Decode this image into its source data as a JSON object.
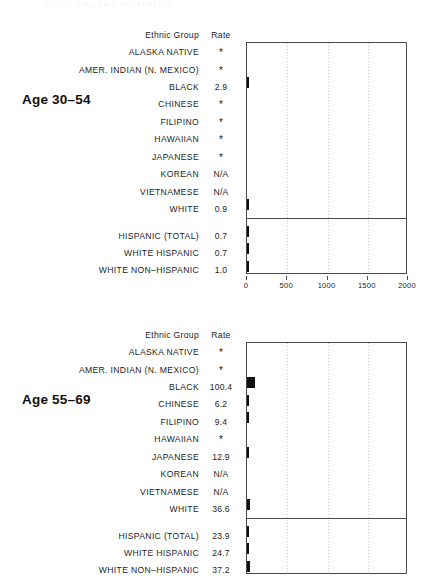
{
  "ghost_text": "Lung cancer mortality",
  "columns": {
    "group_header": "Ethnic Group",
    "rate_header": "Rate"
  },
  "axis": {
    "ticks": [
      0,
      500,
      1000,
      1500,
      2000
    ],
    "tick_labels": [
      "0",
      "500",
      "1000",
      "1500",
      "2000"
    ],
    "min": 0,
    "max": 2000
  },
  "panels": [
    {
      "age_label": "Age 30–54",
      "axis_visible": true,
      "rows": [
        {
          "group": "ALASKA NATIVE",
          "rate": "*",
          "value": null
        },
        {
          "group": "AMER. INDIAN (N. MEXICO)",
          "rate": "*",
          "value": null
        },
        {
          "group": "BLACK",
          "rate": "2.9",
          "value": 2.9
        },
        {
          "group": "CHINESE",
          "rate": "*",
          "value": null
        },
        {
          "group": "FILIPINO",
          "rate": "*",
          "value": null
        },
        {
          "group": "HAWAIIAN",
          "rate": "*",
          "value": null
        },
        {
          "group": "JAPANESE",
          "rate": "*",
          "value": null
        },
        {
          "group": "KOREAN",
          "rate": "N/A",
          "value": null
        },
        {
          "group": "VIETNAMESE",
          "rate": "N/A",
          "value": null
        },
        {
          "group": "WHITE",
          "rate": "0.9",
          "value": 0.9
        },
        {
          "group": "HISPANIC (TOTAL)",
          "rate": "0.7",
          "value": 0.7
        },
        {
          "group": "WHITE HISPANIC",
          "rate": "0.7",
          "value": 0.7
        },
        {
          "group": "WHITE NON–HISPANIC",
          "rate": "1.0",
          "value": 1.0
        }
      ]
    },
    {
      "age_label": "Age 55–69",
      "axis_visible": false,
      "rows": [
        {
          "group": "ALASKA NATIVE",
          "rate": "*",
          "value": null
        },
        {
          "group": "AMER. INDIAN (N. MEXICO)",
          "rate": "*",
          "value": null
        },
        {
          "group": "BLACK",
          "rate": "100.4",
          "value": 100.4
        },
        {
          "group": "CHINESE",
          "rate": "6.2",
          "value": 6.2
        },
        {
          "group": "FILIPINO",
          "rate": "9.4",
          "value": 9.4
        },
        {
          "group": "HAWAIIAN",
          "rate": "*",
          "value": null
        },
        {
          "group": "JAPANESE",
          "rate": "12.9",
          "value": 12.9
        },
        {
          "group": "KOREAN",
          "rate": "N/A",
          "value": null
        },
        {
          "group": "VIETNAMESE",
          "rate": "N/A",
          "value": null
        },
        {
          "group": "WHITE",
          "rate": "36.6",
          "value": 36.6
        },
        {
          "group": "HISPANIC (TOTAL)",
          "rate": "23.9",
          "value": 23.9
        },
        {
          "group": "WHITE HISPANIC",
          "rate": "24.7",
          "value": 24.7
        },
        {
          "group": "WHITE NON–HISPANIC",
          "rate": "37.2",
          "value": 37.2
        }
      ]
    }
  ],
  "chart_data": {
    "type": "bar",
    "title": "",
    "xlabel": "",
    "ylabel": "Ethnic Group",
    "xlim": [
      0,
      2000
    ],
    "grid": true,
    "legend": "none",
    "orientation": "horizontal",
    "categories": [
      "ALASKA NATIVE",
      "AMER. INDIAN (N. MEXICO)",
      "BLACK",
      "CHINESE",
      "FILIPINO",
      "HAWAIIAN",
      "JAPANESE",
      "KOREAN",
      "VIETNAMESE",
      "WHITE",
      "HISPANIC (TOTAL)",
      "WHITE HISPANIC",
      "WHITE NON–HISPANIC"
    ],
    "series": [
      {
        "name": "Age 30–54",
        "values": [
          null,
          null,
          2.9,
          null,
          null,
          null,
          null,
          null,
          null,
          0.9,
          0.7,
          0.7,
          1.0
        ],
        "labels": [
          "*",
          "*",
          "2.9",
          "*",
          "*",
          "*",
          "*",
          "N/A",
          "N/A",
          "0.9",
          "0.7",
          "0.7",
          "1.0"
        ]
      },
      {
        "name": "Age 55–69",
        "values": [
          null,
          null,
          100.4,
          6.2,
          9.4,
          null,
          12.9,
          null,
          null,
          36.6,
          23.9,
          24.7,
          37.2
        ],
        "labels": [
          "*",
          "*",
          "100.4",
          "6.2",
          "9.4",
          "*",
          "12.9",
          "N/A",
          "N/A",
          "36.6",
          "23.9",
          "24.7",
          "37.2"
        ]
      }
    ],
    "notes": {
      "asterisk": "*",
      "not_available": "N/A"
    }
  }
}
